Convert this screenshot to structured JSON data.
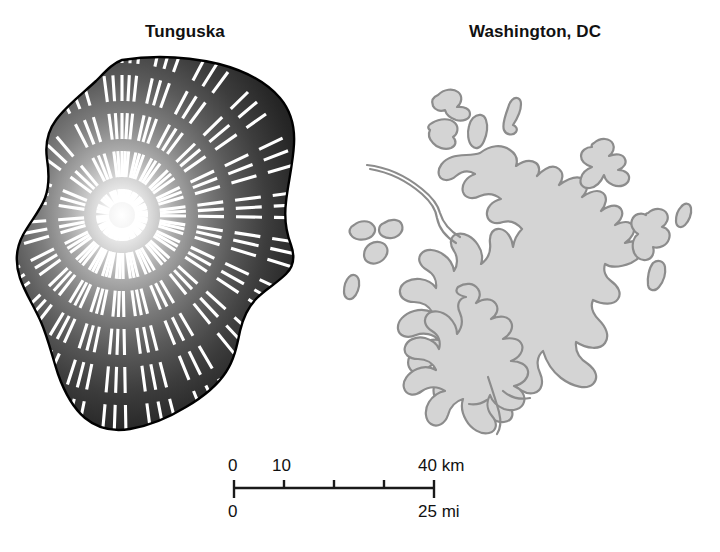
{
  "figure": {
    "width": 720,
    "height": 552,
    "background_color": "#ffffff"
  },
  "panels": [
    {
      "id": "tunguska",
      "title": "Tunguska",
      "description": "Blast devastation zone with radial flattened-forest tree-fall lines",
      "fill_center_color": "#ffffff",
      "fill_edge_color": "#0e0e0e",
      "outline_color": "#000000"
    },
    {
      "id": "washington",
      "title": "Washington, DC",
      "description": "Urbanized area outline at the same scale",
      "fill_color": "#d4d4d4",
      "outline_color": "#8c8c8c",
      "river_color": "#8c8c8c"
    }
  ],
  "scalebar": {
    "km": {
      "unit_label": "km",
      "labels": [
        "0",
        "10",
        "40 km"
      ],
      "tick_values": [
        0,
        10,
        20,
        30,
        40
      ],
      "max": 40
    },
    "mi": {
      "unit_label": "mi",
      "labels": [
        "0",
        "25 mi"
      ],
      "max": 25
    },
    "bar_color": "#1a1a1a",
    "bar_length_px": 200,
    "tick_count": 5
  }
}
